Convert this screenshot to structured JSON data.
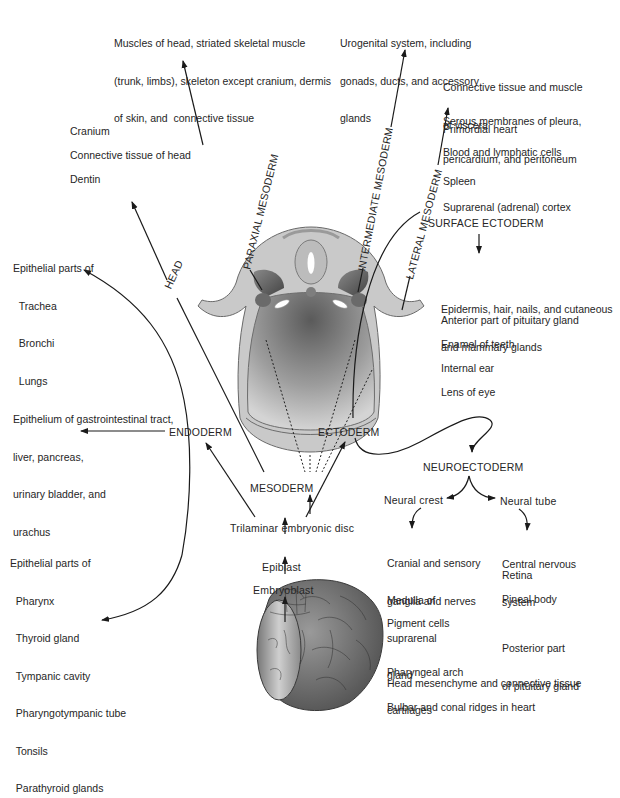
{
  "diagram": {
    "type": "embryonic germ layer derivatives flowchart",
    "origin_chain": [
      "Embryoblast",
      "Epiblast",
      "Trilaminar embryonic disc"
    ],
    "germ_layers": {
      "endoderm": "ENDODERM",
      "mesoderm": "MESODERM",
      "ectoderm": "ECTODERM"
    },
    "mesoderm_branches": {
      "head": "HEAD",
      "paraxial": "PARAXIAL MESODERM",
      "intermediate": "INTERMEDIATE MESODERM",
      "lateral": "LATERAL MESODERM"
    },
    "ectoderm_branches": {
      "surface": "SURFACE ECTODERM",
      "neuro": "NEUROECTODERM",
      "neural_crest": "Neural crest",
      "neural_tube": "Neural tube"
    }
  },
  "derivatives": {
    "paraxial": [
      "Muscles of head, striated skeletal muscle",
      "(trunk, limbs), skeleton except cranium, dermis",
      "of skin, and  connective tissue"
    ],
    "intermediate": [
      "Urogenital system, including",
      "gonads, ducts, and accessory",
      "glands"
    ],
    "lateral": [
      [
        "Connective tissue and muscle",
        "of viscera"
      ],
      [
        "Serous membranes of pleura,",
        "pericardium, and peritoneum"
      ],
      [
        "Primordial heart"
      ],
      [
        "Blood and lymphatic cells"
      ],
      [
        "Spleen"
      ],
      [
        "Suprarenal (adrenal) cortex"
      ]
    ],
    "head": [
      "Cranium",
      "Connective tissue of head",
      "Dentin"
    ],
    "endoderm_respiratory": [
      "Epithelial parts of",
      "  Trachea",
      "  Bronchi",
      "  Lungs"
    ],
    "endoderm_gi": [
      "Epithelium of gastrointestinal tract,",
      "liver, pancreas,",
      "urinary bladder, and",
      "urachus"
    ],
    "endoderm_pharyngeal": [
      "Epithelial parts of",
      "  Pharynx",
      "  Thyroid gland",
      "  Tympanic cavity",
      "  Pharyngotympanic tube",
      "  Tonsils",
      "  Parathyroid glands"
    ],
    "surface_ectoderm": [
      [
        "Epidermis, hair, nails, and cutaneous",
        "and mammary glands"
      ],
      [
        "Anterior part of pituitary gland"
      ],
      [
        "Enamel of teeth"
      ],
      [
        "Internal ear"
      ],
      [
        "Lens of eye"
      ]
    ],
    "neural_crest": [
      [
        "Cranial and sensory",
        "ganglia and nerves"
      ],
      [
        "Medulla of",
        "suprarenal",
        "gland"
      ],
      [
        "Pigment cells"
      ],
      [
        "Pharyngeal arch",
        "cartilages"
      ]
    ],
    "neural_tube": [
      [
        "Central nervous",
        "system"
      ],
      [
        "Retina"
      ],
      [
        "Pineal body"
      ],
      [
        "Posterior part",
        "of pituitary gland"
      ]
    ],
    "neural_crest_wide": [
      "Head mesenchyme and connective tissue",
      "Bulbar and conal ridges in heart"
    ]
  },
  "colors": {
    "line": "#1a1a1a",
    "tissue_light": "#c8c8c8",
    "tissue_mid": "#9a9a9a",
    "tissue_dark": "#555555"
  }
}
